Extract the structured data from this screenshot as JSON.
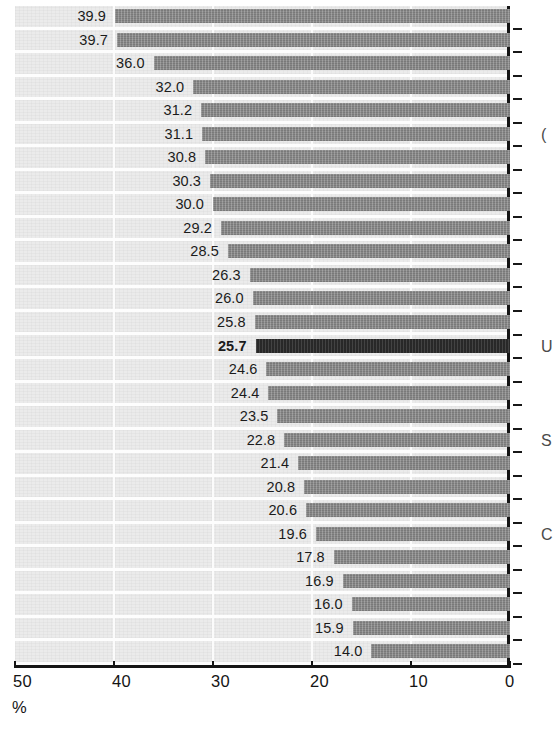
{
  "chart_data": {
    "type": "bar",
    "orientation": "horizontal",
    "title": "",
    "subtitle": "",
    "xlabel": "%",
    "ylabel": "",
    "xlim": [
      50,
      0
    ],
    "x_axis_reversed": true,
    "grid": "vertical-white-gridlines",
    "legend": "none",
    "tick_labels": [
      "50",
      "40",
      "30",
      "20",
      "10",
      "0"
    ],
    "tick_values": [
      50,
      40,
      30,
      20,
      10,
      0
    ],
    "unit_label": "%",
    "bar_color": "#8a8a8a",
    "highlight_color": "#2e2e2e",
    "plot_background": "#ebebeb",
    "axis_color": "#151515",
    "categories": [
      "",
      "",
      "",
      "",
      "",
      "",
      "",
      "",
      "",
      "",
      "",
      "",
      "",
      "",
      "",
      "",
      "",
      "",
      "",
      "",
      "",
      "",
      "",
      "",
      "",
      "",
      "",
      ""
    ],
    "values": [
      39.9,
      39.7,
      36.0,
      32.0,
      31.2,
      31.1,
      30.8,
      30.3,
      30.0,
      29.2,
      28.5,
      26.3,
      26.0,
      25.8,
      25.7,
      24.6,
      24.4,
      23.5,
      22.8,
      21.4,
      20.8,
      20.6,
      19.6,
      17.8,
      16.9,
      16.0,
      15.9,
      14.0
    ],
    "data_labels": [
      "39.9",
      "39.7",
      "36.0",
      "32.0",
      "31.2",
      "31.1",
      "30.8",
      "30.3",
      "30.0",
      "29.2",
      "28.5",
      "26.3",
      "26.0",
      "25.8",
      "25.7",
      "24.6",
      "24.4",
      "23.5",
      "22.8",
      "21.4",
      "20.8",
      "20.6",
      "19.6",
      "17.8",
      "16.9",
      "16.0",
      "15.9",
      "14.0"
    ],
    "highlighted_index": 14,
    "highlighted_value": "25.7",
    "bar_count": 28
  },
  "edge_labels": [
    {
      "text": "(",
      "row": 5
    },
    {
      "text": "U",
      "row": 14
    },
    {
      "text": "S",
      "row": 18
    },
    {
      "text": "C",
      "row": 22
    }
  ]
}
